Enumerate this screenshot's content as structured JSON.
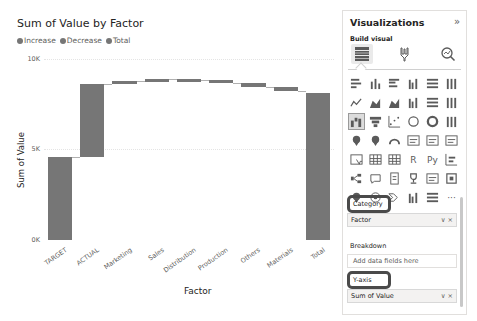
{
  "chart": {
    "title": "Sum of Value by Factor",
    "legend": [
      {
        "label": "Increase",
        "color": "#767676"
      },
      {
        "label": "Decrease",
        "color": "#767676"
      },
      {
        "label": "Total",
        "color": "#767676"
      }
    ],
    "y_ticks": [
      "10K",
      "5K",
      "0K"
    ],
    "y_axis_label": "Sum of Value",
    "x_axis_label": "Factor"
  },
  "chart_data": {
    "type": "bar",
    "subtype": "waterfall",
    "title": "Sum of Value by Factor",
    "xlabel": "Factor",
    "ylabel": "Sum of Value",
    "ylim": [
      0,
      10000
    ],
    "y_ticks": [
      "0K",
      "5K",
      "10K"
    ],
    "legend": [
      "Increase",
      "Decrease",
      "Total"
    ],
    "legend_position": "top-left",
    "grid": true,
    "categories": [
      "TARGET",
      "ACTUAL",
      "Marketing",
      "Sales",
      "Distribution",
      "Production",
      "Others",
      "Materials",
      "Total"
    ],
    "start": [
      0,
      4600,
      8600,
      8800,
      8900,
      8850,
      8650,
      8450,
      0
    ],
    "end": [
      4600,
      8600,
      8800,
      8900,
      8850,
      8650,
      8450,
      8250,
      8100
    ],
    "deltas": [
      4600,
      4000,
      200,
      100,
      -50,
      -200,
      -200,
      -200,
      8100
    ],
    "bar_color": "#767676"
  },
  "pane": {
    "title": "Visualizations",
    "expand_icon": "»",
    "subtitle": "Build visual",
    "modes": [
      {
        "name": "build-visual",
        "active": true
      },
      {
        "name": "format-visual",
        "active": false
      },
      {
        "name": "analytics",
        "active": false
      }
    ],
    "wells": {
      "category_label": "Category",
      "category_field": "Factor",
      "breakdown_label": "Breakdown",
      "breakdown_placeholder": "Add data fields here",
      "yaxis_label": "Y-axis",
      "yaxis_field": "Sum of Value",
      "field_actions": "∨ ×"
    },
    "viz_icons": [
      "stacked-bar",
      "stacked-column",
      "clustered-bar",
      "clustered-column",
      "100-bar",
      "100-column",
      "line",
      "area",
      "stacked-area",
      "line-stacked-column",
      "line-clustered-column",
      "ribbon",
      "waterfall",
      "funnel",
      "scatter",
      "pie",
      "donut",
      "treemap",
      "map",
      "filled-map",
      "gauge",
      "card",
      "multi-row-card",
      "kpi",
      "slicer",
      "table",
      "matrix",
      "R",
      "Py",
      "key-influencers",
      "decomposition-tree",
      "qa",
      "smart-narrative",
      "goals",
      "paginated",
      "power-apps",
      "azure-map",
      "arcgis",
      "power-automate",
      "more-1",
      "more-2",
      "ellipsis"
    ],
    "viz_text": {
      "R": "R",
      "Py": "Py",
      "ellipsis": "···"
    }
  }
}
